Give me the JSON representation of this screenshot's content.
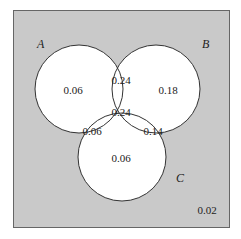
{
  "diagram": {
    "type": "venn-3",
    "background_color": "#c9c9c9",
    "circle_fill": "#ffffff",
    "stroke_color": "#333333",
    "sets": [
      {
        "id": "A",
        "label": "A"
      },
      {
        "id": "B",
        "label": "B"
      },
      {
        "id": "C",
        "label": "C"
      }
    ],
    "regions": {
      "A_only": "0.06",
      "B_only": "0.18",
      "C_only": "0.06",
      "AB_only": "0.24",
      "AC_only": "0.06",
      "BC_only": "0.14",
      "ABC": "0.24",
      "outside": "0.02"
    }
  }
}
